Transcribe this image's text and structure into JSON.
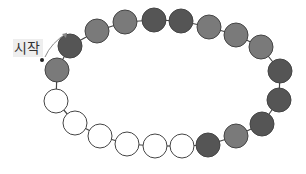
{
  "diagram": {
    "title": "",
    "start_label": "시작",
    "colors": {
      "dark": "#555555",
      "medium": "#7a7a7a",
      "white": "#ffffff",
      "outline": "#444444",
      "string": "#444444",
      "arrow": "#888888"
    },
    "bead_radius": 12,
    "beads": [
      {
        "x": 57,
        "y": 70,
        "shade": "medium"
      },
      {
        "x": 70,
        "y": 46,
        "shade": "dark"
      },
      {
        "x": 97,
        "y": 31,
        "shade": "medium"
      },
      {
        "x": 125,
        "y": 22,
        "shade": "medium"
      },
      {
        "x": 154,
        "y": 20,
        "shade": "dark"
      },
      {
        "x": 181,
        "y": 21,
        "shade": "dark"
      },
      {
        "x": 209,
        "y": 27,
        "shade": "medium"
      },
      {
        "x": 236,
        "y": 35,
        "shade": "medium"
      },
      {
        "x": 261,
        "y": 47,
        "shade": "medium"
      },
      {
        "x": 280,
        "y": 71,
        "shade": "dark"
      },
      {
        "x": 279,
        "y": 100,
        "shade": "dark"
      },
      {
        "x": 262,
        "y": 124,
        "shade": "dark"
      },
      {
        "x": 236,
        "y": 136,
        "shade": "medium"
      },
      {
        "x": 208,
        "y": 145,
        "shade": "dark"
      },
      {
        "x": 182,
        "y": 146,
        "shade": "white"
      },
      {
        "x": 155,
        "y": 146,
        "shade": "white"
      },
      {
        "x": 127,
        "y": 144,
        "shade": "white"
      },
      {
        "x": 100,
        "y": 136,
        "shade": "white"
      },
      {
        "x": 75,
        "y": 123,
        "shade": "white"
      },
      {
        "x": 56,
        "y": 101,
        "shade": "white"
      }
    ],
    "start_dot": {
      "x": 42,
      "y": 60
    },
    "arrow": {
      "from": [
        45,
        57
      ],
      "to": [
        67,
        33
      ]
    }
  }
}
